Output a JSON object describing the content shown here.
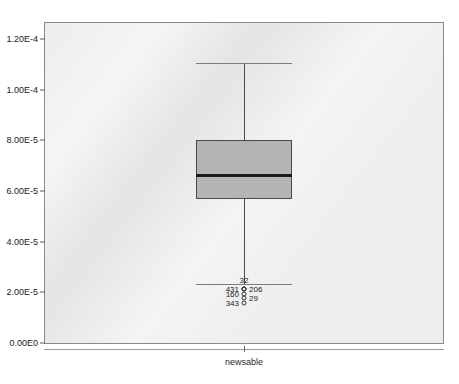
{
  "header": {
    "ghost_text": "                          "
  },
  "axis": {
    "x_label": "newsable",
    "y_ticks": [
      {
        "label": "1.20E-4",
        "value": 0.00012
      },
      {
        "label": "1.00E-4",
        "value": 0.0001
      },
      {
        "label": "8.00E-5",
        "value": 8e-05
      },
      {
        "label": "6.00E-5",
        "value": 6e-05
      },
      {
        "label": "4.00E-5",
        "value": 4e-05
      },
      {
        "label": "2.00E-5",
        "value": 2e-05
      },
      {
        "label": "0.00E0",
        "value": 0
      }
    ]
  },
  "colors": {
    "plot_background": "#ededec",
    "plot_border": "#8a8a8a",
    "box_fill": "#b4b4b4",
    "box_border": "#4a4a4a",
    "median": "#1b1b1b",
    "whisker": "#4a4a4a",
    "outlier_stroke": "#3a3a3a",
    "text": "#1a1a1a",
    "page_background": "#ffffff"
  },
  "chart_data": {
    "type": "box",
    "title": "",
    "subtitle": "",
    "xlabel": "",
    "ylabel": "",
    "categories": [
      "newsable"
    ],
    "ylim": [
      0,
      0.0001305
    ],
    "grid": false,
    "legend": "none",
    "boxes": [
      {
        "category": "newsable",
        "whisker_high": 0.0001105,
        "q3": 8e-05,
        "median": 6.63e-05,
        "q1": 5.68e-05,
        "whisker_low": 2.32e-05,
        "outliers": [
          {
            "label": "32",
            "value": 2.15e-05,
            "label_pos": "above"
          },
          {
            "label": "431",
            "value": 2.12e-05,
            "label_pos": "left"
          },
          {
            "label": "206",
            "value": 2.12e-05,
            "label_pos": "right"
          },
          {
            "label": "160",
            "value": 1.92e-05,
            "label_pos": "left"
          },
          {
            "label": "29",
            "value": 1.78e-05,
            "label_pos": "right"
          },
          {
            "label": "343",
            "value": 1.57e-05,
            "label_pos": "left"
          }
        ]
      }
    ]
  }
}
